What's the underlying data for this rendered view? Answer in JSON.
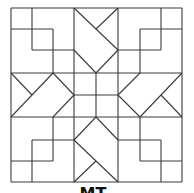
{
  "figure": {
    "line_color": "#3a3a3a",
    "background": "#ffffff",
    "caption_partial": "MT"
  }
}
